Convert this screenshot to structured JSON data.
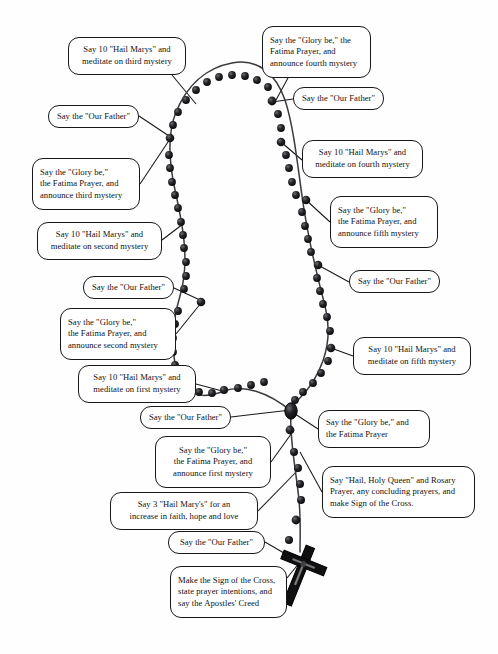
{
  "diagram": {
    "background_color": "#fefefe",
    "ink_color": "#17181a",
    "bead_color": "#1a1a1c"
  },
  "callouts": [
    {
      "id": "hail-marys-third-mystery",
      "align": "center",
      "lines": [
        "Say 10 \"Hail Marys\" and",
        "meditate on third mystery"
      ]
    },
    {
      "id": "glory-be-fourth-mystery",
      "align": "left",
      "lines": [
        "Say the \"Glory be,\" the",
        "Fatima Prayer, and",
        "announce fourth mystery"
      ]
    },
    {
      "id": "our-father-fourth",
      "align": "center",
      "lines": [
        "Say the \"Our Father\""
      ]
    },
    {
      "id": "our-father-third",
      "align": "center",
      "lines": [
        "Say the \"Our Father\""
      ]
    },
    {
      "id": "hail-marys-fourth-mystery",
      "align": "center",
      "lines": [
        "Say 10 \"Hail Marys\" and",
        "meditate on fourth mystery"
      ]
    },
    {
      "id": "glory-be-third-mystery",
      "align": "left",
      "lines": [
        "Say the \"Glory be,\"",
        "the Fatima Prayer, and",
        "announce third mystery"
      ]
    },
    {
      "id": "glory-be-fifth-mystery",
      "align": "left",
      "lines": [
        "Say the \"Glory be,\"",
        "the Fatima Prayer, and",
        "announce fifth mystery"
      ]
    },
    {
      "id": "hail-marys-second-mystery",
      "align": "center",
      "lines": [
        "Say 10 \"Hail Marys\" and",
        "meditate on second mystery"
      ]
    },
    {
      "id": "our-father-fifth",
      "align": "center",
      "lines": [
        "Say the \"Our Father\""
      ]
    },
    {
      "id": "our-father-second",
      "align": "center",
      "lines": [
        "Say the \"Our Father\""
      ]
    },
    {
      "id": "glory-be-second-mystery",
      "align": "left",
      "lines": [
        "Say the \"Glory be,\"",
        "the Fatima Prayer, and",
        "announce second mystery"
      ]
    },
    {
      "id": "hail-marys-fifth-mystery",
      "align": "center",
      "lines": [
        "Say 10 \"Hail Marys\" and",
        "meditate on fifth mystery"
      ]
    },
    {
      "id": "hail-marys-first-mystery",
      "align": "center",
      "lines": [
        "Say 10 \"Hail Marys\" and",
        "meditate on first mystery"
      ]
    },
    {
      "id": "our-father-first",
      "align": "center",
      "lines": [
        "Say the \"Our Father\""
      ]
    },
    {
      "id": "glory-be-fatima-prayer",
      "align": "left",
      "lines": [
        "Say the \"Glory be,\" and",
        "the Fatima Prayer"
      ]
    },
    {
      "id": "glory-be-first-mystery",
      "align": "center",
      "lines": [
        "Say the \"Glory be,\"",
        "the Fatima Prayer, and",
        "announce first mystery"
      ]
    },
    {
      "id": "hail-marys-three-virtues",
      "align": "center",
      "lines": [
        "Say 3 \"Hail Mary's\" for an",
        "increase in faith, hope and love"
      ]
    },
    {
      "id": "hail-holy-queen",
      "align": "left",
      "lines": [
        "Say \"Hail, Holy Queen\" and Rosary",
        "Prayer, any concluding prayers, and",
        "make Sign of the Cross."
      ]
    },
    {
      "id": "our-father-opening",
      "align": "center",
      "lines": [
        "Say the \"Our Father\""
      ]
    },
    {
      "id": "sign-of-the-cross-creed",
      "align": "left",
      "lines": [
        "Make the Sign of the Cross,",
        "state prayer intentions, and",
        "say the Apostles' Creed"
      ]
    }
  ],
  "layout": {
    "boxes": {
      "hail-marys-third-mystery": {
        "x": 68,
        "y": 37,
        "w": 118,
        "h": 38
      },
      "glory-be-fourth-mystery": {
        "x": 262,
        "y": 26,
        "w": 109,
        "h": 52
      },
      "our-father-fourth": {
        "x": 293,
        "y": 87,
        "w": 91,
        "h": 23
      },
      "our-father-third": {
        "x": 48,
        "y": 105,
        "w": 91,
        "h": 23
      },
      "hail-marys-fourth-mystery": {
        "x": 302,
        "y": 140,
        "w": 121,
        "h": 38
      },
      "glory-be-third-mystery": {
        "x": 32,
        "y": 158,
        "w": 108,
        "h": 52
      },
      "glory-be-fifth-mystery": {
        "x": 330,
        "y": 196,
        "w": 108,
        "h": 52
      },
      "hail-marys-second-mystery": {
        "x": 37,
        "y": 222,
        "w": 125,
        "h": 38
      },
      "our-father-fifth": {
        "x": 349,
        "y": 270,
        "w": 91,
        "h": 23
      },
      "our-father-second": {
        "x": 83,
        "y": 276,
        "w": 91,
        "h": 23
      },
      "glory-be-second-mystery": {
        "x": 60,
        "y": 308,
        "w": 116,
        "h": 52
      },
      "hail-marys-fifth-mystery": {
        "x": 353,
        "y": 337,
        "w": 118,
        "h": 38
      },
      "hail-marys-first-mystery": {
        "x": 78,
        "y": 365,
        "w": 118,
        "h": 38
      },
      "our-father-first": {
        "x": 140,
        "y": 406,
        "w": 91,
        "h": 23
      },
      "glory-be-fatima-prayer": {
        "x": 318,
        "y": 410,
        "w": 112,
        "h": 38
      },
      "glory-be-first-mystery": {
        "x": 155,
        "y": 436,
        "w": 116,
        "h": 52
      },
      "hail-marys-three-virtues": {
        "x": 110,
        "y": 492,
        "w": 148,
        "h": 38
      },
      "hail-holy-queen": {
        "x": 322,
        "y": 466,
        "w": 153,
        "h": 52
      },
      "our-father-opening": {
        "x": 168,
        "y": 531,
        "w": 97,
        "h": 23
      },
      "sign-of-the-cross-creed": {
        "x": 170,
        "y": 566,
        "w": 117,
        "h": 52
      }
    }
  }
}
